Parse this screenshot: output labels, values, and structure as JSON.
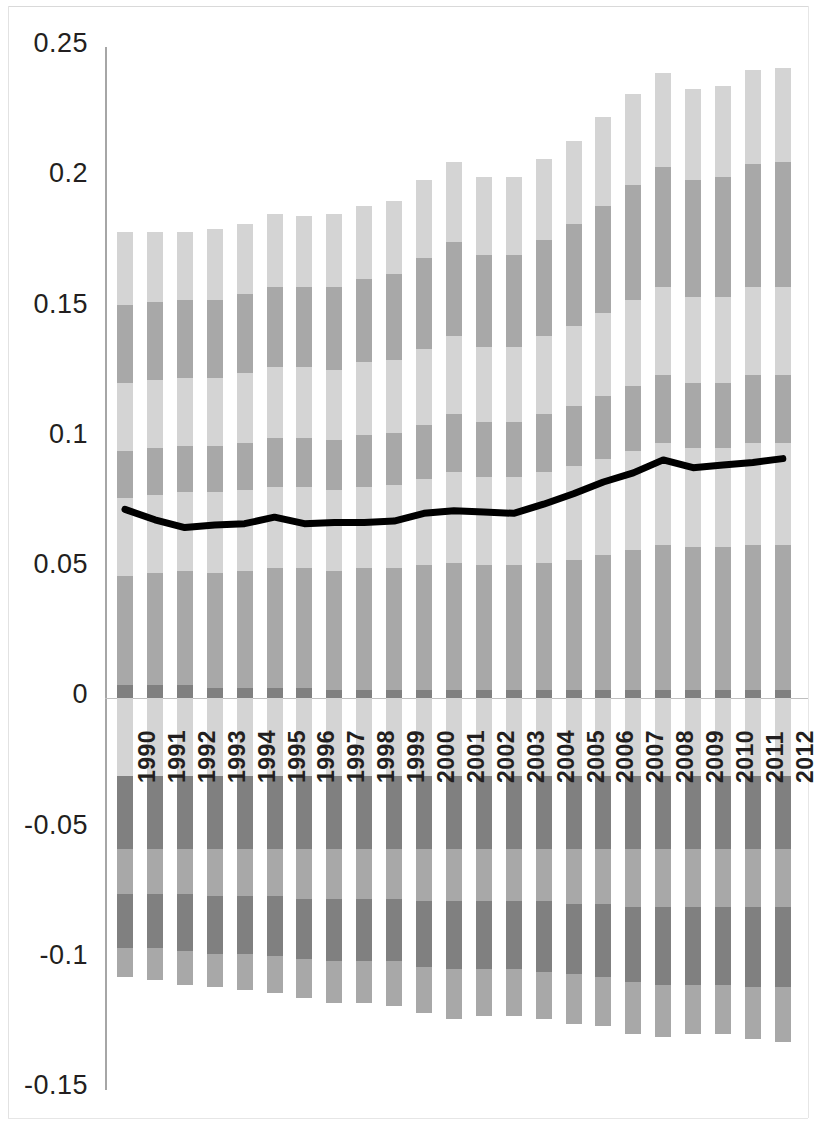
{
  "chart_data": {
    "type": "bar",
    "subtype": "stacked-bar-with-line-overlay",
    "title": "",
    "subtitle": "",
    "xlabel": "",
    "ylabel": "",
    "ylim": [
      -0.15,
      0.25
    ],
    "ytick_values": [
      0.25,
      0.2,
      0.15,
      0.1,
      0.05,
      0,
      -0.05,
      -0.1,
      -0.15
    ],
    "ytick_labels": [
      "0.25",
      "0.2",
      "0.15",
      "0.1",
      "0.05",
      "0",
      "-0.05",
      "-0.1",
      "-0.15"
    ],
    "grid": false,
    "legend": "none",
    "categories": [
      "1990",
      "1991",
      "1992",
      "1993",
      "1994",
      "1995",
      "1996",
      "1997",
      "1998",
      "1999",
      "2000",
      "2001",
      "2002",
      "2003",
      "2004",
      "2005",
      "2006",
      "2007",
      "2008",
      "2009",
      "2010",
      "2011",
      "2012"
    ],
    "colors": {
      "light": "#d4d4d4",
      "medium": "#a8a8a8",
      "dark": "#808080",
      "line": "#000000",
      "axis": "#a6a6a6",
      "baseline": "#bfbfbf",
      "text": "#231f20",
      "background": "#ffffff"
    },
    "series": [
      {
        "name": "pos-seg-1",
        "stack": "positive",
        "order": 1,
        "shade": "dark",
        "values": [
          0.005,
          0.005,
          0.005,
          0.004,
          0.004,
          0.004,
          0.004,
          0.003,
          0.003,
          0.003,
          0.003,
          0.003,
          0.003,
          0.003,
          0.003,
          0.003,
          0.003,
          0.003,
          0.003,
          0.003,
          0.003,
          0.003,
          0.003
        ]
      },
      {
        "name": "pos-seg-2",
        "stack": "positive",
        "order": 2,
        "shade": "medium",
        "values": [
          0.042,
          0.043,
          0.044,
          0.044,
          0.045,
          0.046,
          0.046,
          0.046,
          0.047,
          0.047,
          0.048,
          0.049,
          0.048,
          0.048,
          0.049,
          0.05,
          0.052,
          0.054,
          0.056,
          0.055,
          0.055,
          0.056,
          0.056
        ]
      },
      {
        "name": "pos-seg-3",
        "stack": "positive",
        "order": 3,
        "shade": "light",
        "values": [
          0.03,
          0.03,
          0.03,
          0.031,
          0.031,
          0.031,
          0.031,
          0.031,
          0.031,
          0.032,
          0.033,
          0.035,
          0.034,
          0.034,
          0.035,
          0.036,
          0.037,
          0.038,
          0.039,
          0.038,
          0.038,
          0.039,
          0.039
        ]
      },
      {
        "name": "pos-seg-4",
        "stack": "positive",
        "order": 4,
        "shade": "medium",
        "values": [
          0.018,
          0.018,
          0.018,
          0.018,
          0.018,
          0.019,
          0.019,
          0.019,
          0.02,
          0.02,
          0.021,
          0.022,
          0.021,
          0.021,
          0.022,
          0.023,
          0.024,
          0.025,
          0.026,
          0.025,
          0.025,
          0.026,
          0.026
        ]
      },
      {
        "name": "pos-seg-5",
        "stack": "positive",
        "order": 5,
        "shade": "light",
        "values": [
          0.026,
          0.026,
          0.026,
          0.026,
          0.027,
          0.027,
          0.027,
          0.027,
          0.028,
          0.028,
          0.029,
          0.03,
          0.029,
          0.029,
          0.03,
          0.031,
          0.032,
          0.033,
          0.034,
          0.033,
          0.033,
          0.034,
          0.034
        ]
      },
      {
        "name": "pos-seg-6",
        "stack": "positive",
        "order": 6,
        "shade": "medium",
        "values": [
          0.03,
          0.03,
          0.03,
          0.03,
          0.03,
          0.031,
          0.031,
          0.032,
          0.032,
          0.033,
          0.035,
          0.036,
          0.035,
          0.035,
          0.037,
          0.039,
          0.041,
          0.044,
          0.046,
          0.045,
          0.046,
          0.047,
          0.048
        ]
      },
      {
        "name": "pos-seg-7",
        "stack": "positive",
        "order": 7,
        "shade": "light",
        "values": [
          0.028,
          0.027,
          0.026,
          0.027,
          0.027,
          0.028,
          0.027,
          0.028,
          0.028,
          0.028,
          0.03,
          0.031,
          0.03,
          0.03,
          0.031,
          0.032,
          0.034,
          0.035,
          0.036,
          0.035,
          0.035,
          0.036,
          0.036
        ]
      },
      {
        "name": "neg-seg-1",
        "stack": "negative",
        "order": 1,
        "shade": "light",
        "values": [
          -0.03,
          -0.03,
          -0.03,
          -0.03,
          -0.03,
          -0.03,
          -0.03,
          -0.03,
          -0.03,
          -0.03,
          -0.03,
          -0.03,
          -0.03,
          -0.03,
          -0.03,
          -0.03,
          -0.03,
          -0.03,
          -0.03,
          -0.03,
          -0.03,
          -0.03,
          -0.03
        ]
      },
      {
        "name": "neg-seg-2",
        "stack": "negative",
        "order": 2,
        "shade": "dark",
        "values": [
          -0.028,
          -0.028,
          -0.028,
          -0.028,
          -0.028,
          -0.028,
          -0.028,
          -0.028,
          -0.028,
          -0.028,
          -0.028,
          -0.028,
          -0.028,
          -0.028,
          -0.028,
          -0.028,
          -0.028,
          -0.028,
          -0.028,
          -0.028,
          -0.028,
          -0.028,
          -0.028
        ]
      },
      {
        "name": "neg-seg-3",
        "stack": "negative",
        "order": 3,
        "shade": "medium",
        "values": [
          -0.017,
          -0.017,
          -0.017,
          -0.018,
          -0.018,
          -0.018,
          -0.019,
          -0.019,
          -0.019,
          -0.019,
          -0.02,
          -0.02,
          -0.02,
          -0.02,
          -0.02,
          -0.021,
          -0.021,
          -0.022,
          -0.022,
          -0.022,
          -0.022,
          -0.022,
          -0.022
        ]
      },
      {
        "name": "neg-seg-4",
        "stack": "negative",
        "order": 4,
        "shade": "dark",
        "values": [
          -0.021,
          -0.021,
          -0.022,
          -0.022,
          -0.022,
          -0.023,
          -0.023,
          -0.024,
          -0.024,
          -0.024,
          -0.025,
          -0.026,
          -0.026,
          -0.026,
          -0.027,
          -0.027,
          -0.028,
          -0.029,
          -0.03,
          -0.03,
          -0.03,
          -0.031,
          -0.031
        ]
      },
      {
        "name": "neg-seg-5",
        "stack": "negative",
        "order": 5,
        "shade": "medium",
        "values": [
          -0.011,
          -0.012,
          -0.013,
          -0.013,
          -0.014,
          -0.014,
          -0.015,
          -0.016,
          -0.016,
          -0.017,
          -0.018,
          -0.019,
          -0.018,
          -0.018,
          -0.018,
          -0.019,
          -0.019,
          -0.02,
          -0.02,
          -0.019,
          -0.019,
          -0.02,
          -0.021
        ]
      },
      {
        "name": "trend-line",
        "stack": "line",
        "order": 0,
        "shade": "line",
        "values": [
          0.0725,
          0.0685,
          0.0655,
          0.0665,
          0.067,
          0.0695,
          0.067,
          0.0675,
          0.0675,
          0.068,
          0.071,
          0.072,
          0.0715,
          0.071,
          0.0745,
          0.0785,
          0.083,
          0.0865,
          0.0915,
          0.0885,
          0.0895,
          0.0905,
          0.092
        ]
      }
    ],
    "positive_totals": [
      0.179,
      0.179,
      0.179,
      0.18,
      0.182,
      0.186,
      0.185,
      0.186,
      0.189,
      0.191,
      0.199,
      0.206,
      0.2,
      0.2,
      0.207,
      0.214,
      0.223,
      0.232,
      0.24,
      0.234,
      0.235,
      0.241,
      0.242
    ],
    "negative_totals": [
      -0.107,
      -0.108,
      -0.11,
      -0.111,
      -0.112,
      -0.113,
      -0.115,
      -0.117,
      -0.117,
      -0.118,
      -0.121,
      -0.123,
      -0.122,
      -0.122,
      -0.123,
      -0.125,
      -0.126,
      -0.129,
      -0.13,
      -0.129,
      -0.129,
      -0.131,
      -0.132
    ]
  }
}
